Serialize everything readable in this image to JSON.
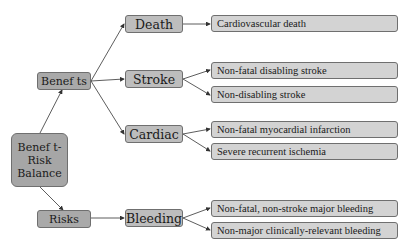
{
  "diagram": {
    "root": {
      "label_lines": [
        "Benef t-",
        "Risk",
        "Balance"
      ]
    },
    "branches": [
      {
        "label": "Benef ts",
        "categories": [
          {
            "label": "Death",
            "outcomes": [
              "Cardiovascular death"
            ]
          },
          {
            "label": "Stroke",
            "outcomes": [
              "Non-fatal disabling stroke",
              "Non-disabling stroke"
            ]
          },
          {
            "label": "Cardiac",
            "outcomes": [
              "Non-fatal myocardial infarction",
              "Severe recurrent ischemia"
            ]
          }
        ]
      },
      {
        "label": "Risks",
        "categories": [
          {
            "label": "Bleeding",
            "outcomes": [
              "Non-fatal, non-stroke major bleeding",
              "Non-major clinically-relevant bleeding"
            ]
          }
        ]
      }
    ]
  },
  "colors": {
    "root_fill": "#a6a6a6",
    "branch_fill": "#a9a9a9",
    "category_fill": "#bdbdbd",
    "outcome_fill": "#d3d3d3",
    "border": "#6f6f6f",
    "arrow": "#333333"
  }
}
